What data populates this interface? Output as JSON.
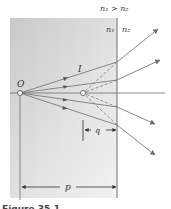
{
  "diagram": {
    "condition": "n₁ > n₂",
    "medium1_label": "n₁",
    "medium2_label": "n₂",
    "object_label": "O",
    "ray_label": "I",
    "image_distance_label": "q",
    "object_distance_label": "p",
    "caption": "Figure 35.1…",
    "colors": {
      "medium1_shade": "#d9d9d9",
      "ray": "#7a7a7a",
      "boundary": "#6f6f6f"
    }
  }
}
